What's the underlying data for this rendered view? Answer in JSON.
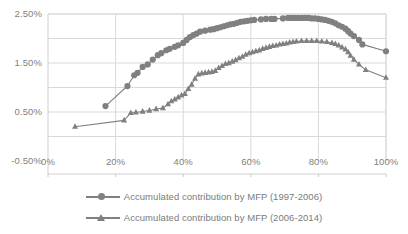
{
  "chart_data": {
    "type": "line",
    "title": "",
    "xlabel": "",
    "ylabel": "",
    "xlim": [
      0,
      100
    ],
    "ylim": [
      -0.5,
      2.5
    ],
    "grid": true,
    "legend_position": "bottom",
    "x_tick_labels": [
      "0%",
      "20%",
      "40%",
      "60%",
      "80%",
      "100%"
    ],
    "x_ticks": [
      0,
      20,
      40,
      60,
      80,
      100
    ],
    "y_tick_labels": [
      "2.50%",
      "1.50%",
      "0.50%",
      "-0.50%"
    ],
    "y_ticks": [
      2.5,
      1.5,
      0.5,
      -0.5
    ],
    "y_gridlines": [
      2.5,
      2.0,
      1.5,
      1.0,
      0.5,
      0.0
    ],
    "series": [
      {
        "name": "Accumulated contribution by MFP (1997-2006)",
        "marker": "circle",
        "color": "#808080",
        "x": [
          17.0,
          23.5,
          25.5,
          26.5,
          28.0,
          29.5,
          31.0,
          32.5,
          33.5,
          35.0,
          36.0,
          37.5,
          38.5,
          40.0,
          41.0,
          42.0,
          43.0,
          44.0,
          45.0,
          46.5,
          48.0,
          49.0,
          50.0,
          51.0,
          52.0,
          53.0,
          54.0,
          55.0,
          56.0,
          57.0,
          58.0,
          59.0,
          60.0,
          61.0,
          63.0,
          64.5,
          66.0,
          67.0,
          69.5,
          71.0,
          72.0,
          73.0,
          74.0,
          75.0,
          76.0,
          77.0,
          78.0,
          79.0,
          80.0,
          81.0,
          82.0,
          83.0,
          84.0,
          85.0,
          86.0,
          87.0,
          88.0,
          88.8,
          89.5,
          90.5,
          92.0,
          93.0,
          100.0
        ],
        "y": [
          0.62,
          1.03,
          1.25,
          1.3,
          1.42,
          1.47,
          1.57,
          1.66,
          1.7,
          1.76,
          1.79,
          1.83,
          1.86,
          1.91,
          1.97,
          2.03,
          2.07,
          2.1,
          2.14,
          2.16,
          2.18,
          2.19,
          2.21,
          2.23,
          2.25,
          2.27,
          2.29,
          2.3,
          2.32,
          2.34,
          2.35,
          2.36,
          2.37,
          2.38,
          2.39,
          2.4,
          2.4,
          2.4,
          2.41,
          2.42,
          2.42,
          2.42,
          2.42,
          2.42,
          2.42,
          2.42,
          2.41,
          2.41,
          2.4,
          2.39,
          2.38,
          2.36,
          2.34,
          2.31,
          2.27,
          2.24,
          2.2,
          2.15,
          2.1,
          2.05,
          1.97,
          1.88,
          1.74
        ],
        "peak": {
          "x": 74,
          "y": 2.42
        },
        "start": {
          "x": 17,
          "y": 0.62
        },
        "end": {
          "x": 100,
          "y": 1.74
        }
      },
      {
        "name": "Accumulated contribution by MFP (2006-2014)",
        "marker": "triangle",
        "color": "#808080",
        "x": [
          8.0,
          22.5,
          24.5,
          26.0,
          28.0,
          30.0,
          32.0,
          34.0,
          35.5,
          36.5,
          37.5,
          38.5,
          39.5,
          40.5,
          41.5,
          42.5,
          43.5,
          44.5,
          45.5,
          46.5,
          47.5,
          48.5,
          49.5,
          50.5,
          51.5,
          52.5,
          53.5,
          54.5,
          55.5,
          56.5,
          57.5,
          58.5,
          59.5,
          60.5,
          61.5,
          62.5,
          63.5,
          64.5,
          65.5,
          66.5,
          67.5,
          68.5,
          69.5,
          70.5,
          71.5,
          72.5,
          73.5,
          75.0,
          76.5,
          78.0,
          79.5,
          81.0,
          82.5,
          84.0,
          85.0,
          86.0,
          87.0,
          88.0,
          88.8,
          89.5,
          90.5,
          92.0,
          94.0,
          100.0
        ],
        "y": [
          0.2,
          0.33,
          0.48,
          0.49,
          0.51,
          0.53,
          0.56,
          0.58,
          0.66,
          0.72,
          0.76,
          0.8,
          0.84,
          0.87,
          0.97,
          1.06,
          1.18,
          1.27,
          1.29,
          1.3,
          1.31,
          1.32,
          1.34,
          1.4,
          1.44,
          1.48,
          1.5,
          1.53,
          1.56,
          1.6,
          1.63,
          1.67,
          1.7,
          1.72,
          1.74,
          1.76,
          1.79,
          1.81,
          1.83,
          1.85,
          1.86,
          1.88,
          1.89,
          1.9,
          1.92,
          1.93,
          1.94,
          1.95,
          1.95,
          1.95,
          1.95,
          1.94,
          1.93,
          1.91,
          1.89,
          1.86,
          1.82,
          1.78,
          1.72,
          1.65,
          1.57,
          1.47,
          1.36,
          1.2
        ],
        "peak": {
          "x": 77,
          "y": 1.95
        },
        "start": {
          "x": 8,
          "y": 0.2
        },
        "end": {
          "x": 100,
          "y": 1.2
        }
      }
    ],
    "colors": {
      "series_line": "#808080",
      "gridline": "#d9d9d9",
      "axis_text": "#808080",
      "plot_background": "#ffffff"
    }
  },
  "legend": {
    "items": [
      {
        "label": "Accumulated contribution by MFP (1997-2006)",
        "marker": "circle-marker"
      },
      {
        "label": "Accumulated contribution by MFP (2006-2014)",
        "marker": "triangle-marker"
      }
    ]
  }
}
